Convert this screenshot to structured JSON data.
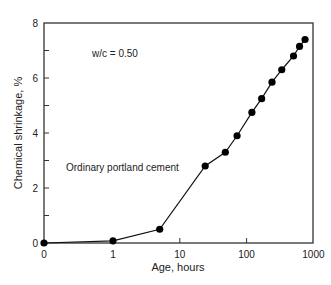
{
  "chart_data": {
    "type": "line",
    "title": "",
    "xlabel": "Age, hours",
    "ylabel": "Chemical shrinkage, %",
    "xscale": "log (with 0 at origin)",
    "x_ticks": [
      "0",
      "1",
      "10",
      "100",
      "1000"
    ],
    "y_ticks": [
      "0",
      "2",
      "4",
      "6",
      "8"
    ],
    "xlim": [
      0,
      1000
    ],
    "ylim": [
      0,
      8
    ],
    "grid": false,
    "legend": null,
    "annotations": [
      {
        "text": "w/c = 0.50",
        "x": 2.5,
        "y": 7.0
      },
      {
        "text": "Ordinary portland cement",
        "x": 0.4,
        "y": 2.8
      }
    ],
    "series": [
      {
        "name": "Ordinary portland cement",
        "marker": "filled-circle",
        "x": [
          0,
          1,
          5,
          24,
          48,
          72,
          120,
          168,
          240,
          336,
          504,
          620,
          750
        ],
        "y": [
          0.0,
          0.08,
          0.5,
          2.8,
          3.3,
          3.9,
          4.75,
          5.25,
          5.85,
          6.3,
          6.8,
          7.15,
          7.4
        ]
      }
    ]
  },
  "labels": {
    "xlabel": "Age, hours",
    "ylabel": "Chemical shrinkage, %",
    "annotation_wc": "w/c = 0.50",
    "annotation_cement": "Ordinary portland cement"
  }
}
